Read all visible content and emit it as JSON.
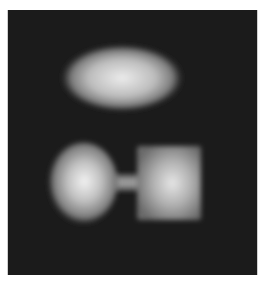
{
  "image": {
    "description": "Grayscale image of blurred bright shapes on dark noisy background",
    "background_color": "#1b1b1b",
    "shapes": [
      {
        "name": "ellipse",
        "cx": 122,
        "cy": 78,
        "rx": 60,
        "ry": 33
      },
      {
        "name": "round-blob",
        "cx": 83,
        "cy": 183,
        "rx": 35,
        "ry": 41
      },
      {
        "name": "neck",
        "x": 112,
        "y": 175,
        "w": 30,
        "h": 15
      },
      {
        "name": "square",
        "x": 137,
        "y": 146,
        "w": 64,
        "h": 74
      }
    ]
  }
}
